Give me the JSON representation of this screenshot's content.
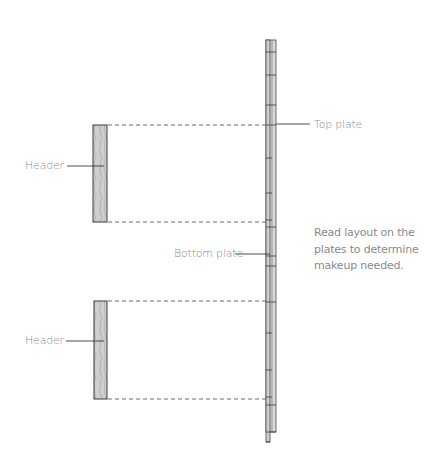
{
  "diagram": {
    "labels": {
      "header_top": "Header",
      "header_bottom": "Header",
      "top_plate": "Top plate",
      "bottom_plate": "Bottom plate"
    },
    "note": {
      "line1": "Read layout on the",
      "line2": "plates to determine",
      "line3": "makeup needed."
    },
    "colors": {
      "line": "#4a4a4a",
      "plate_fill": "#d6d6d6",
      "header_fill": "#c9c9c9",
      "text": "#8a8a8a"
    }
  }
}
